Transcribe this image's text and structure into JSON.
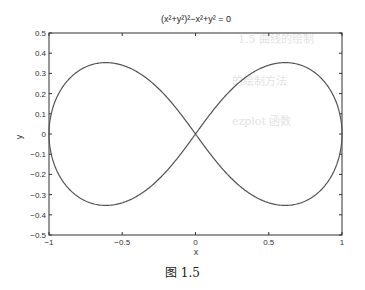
{
  "chart_data": {
    "type": "line",
    "title": "(x²+y²)²−x²+y² = 0",
    "xlabel": "x",
    "ylabel": "y",
    "xlim": [
      -1,
      1
    ],
    "ylim": [
      -0.5,
      0.5
    ],
    "xticks": [
      -1,
      -0.5,
      0,
      0.5,
      1
    ],
    "xtick_labels": [
      "−1",
      "−0.5",
      "0",
      "0.5",
      "1"
    ],
    "yticks": [
      -0.5,
      -0.4,
      -0.3,
      -0.2,
      -0.1,
      0,
      0.1,
      0.2,
      0.3,
      0.4,
      0.5
    ],
    "ytick_labels": [
      "−0.5",
      "−0.4",
      "−0.3",
      "−0.2",
      "−0.1",
      "0",
      "0.1",
      "0.2",
      "0.3",
      "0.4",
      "0.5"
    ],
    "grid": false,
    "legend": null,
    "series": [
      {
        "name": "lemniscate",
        "equation": "(x^2+y^2)^2 - x^2 + y^2 = 0",
        "description": "Lemniscate of Bernoulli, lobes extending to x=±1, max |y| ≈ 0.354 at x ≈ ±0.612, crossing at origin",
        "x": [
          -1,
          -0.9,
          -0.8,
          -0.612,
          -0.4,
          -0.2,
          0,
          0.2,
          0.4,
          0.612,
          0.8,
          0.9,
          1
        ],
        "y_upper": [
          0,
          0.25,
          0.32,
          0.354,
          0.32,
          0.19,
          0,
          0.19,
          0.32,
          0.354,
          0.32,
          0.25,
          0
        ],
        "color": "#555555"
      }
    ]
  },
  "figure": {
    "caption": "图 1.5"
  }
}
